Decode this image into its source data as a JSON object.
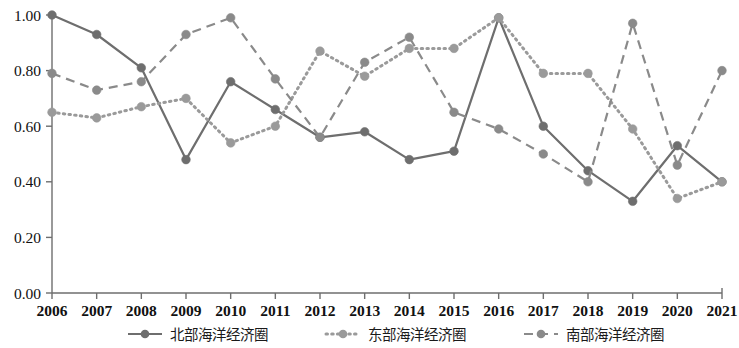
{
  "chart_data": {
    "type": "line",
    "title": "",
    "subtitle": "",
    "xlabel": "",
    "ylabel": "",
    "categories": [
      "2006",
      "2007",
      "2008",
      "2009",
      "2010",
      "2011",
      "2012",
      "2013",
      "2014",
      "2015",
      "2016",
      "2017",
      "2018",
      "2019",
      "2020",
      "2021"
    ],
    "ylim": [
      0.0,
      1.0
    ],
    "xlim": [
      "2006",
      "2021"
    ],
    "ytick_labels": [
      "0.00",
      "0.20",
      "0.40",
      "0.60",
      "0.80",
      "1.00"
    ],
    "ytick_values": [
      0.0,
      0.2,
      0.4,
      0.6,
      0.8,
      1.0
    ],
    "grid": false,
    "legend_position": "bottom",
    "series": [
      {
        "name": "北部海洋经济圈",
        "style": "solid",
        "color": "#6e6e6e",
        "marker": "circle",
        "values": [
          1.0,
          0.93,
          0.81,
          0.48,
          0.76,
          0.66,
          0.56,
          0.58,
          0.48,
          0.51,
          0.99,
          0.6,
          0.44,
          0.33,
          0.53,
          0.4
        ]
      },
      {
        "name": "东部海洋经济圈",
        "style": "dotted",
        "color": "#9a9a9a",
        "marker": "circle",
        "values": [
          0.65,
          0.63,
          0.67,
          0.7,
          0.54,
          0.6,
          0.87,
          0.78,
          0.88,
          0.88,
          0.99,
          0.79,
          0.79,
          0.59,
          0.34,
          0.4
        ]
      },
      {
        "name": "南部海洋经济圈",
        "style": "dashed",
        "color": "#8a8a8a",
        "marker": "circle",
        "values": [
          0.79,
          0.73,
          0.76,
          0.93,
          0.99,
          0.77,
          0.56,
          0.83,
          0.92,
          0.65,
          0.59,
          0.5,
          0.4,
          0.97,
          0.46,
          0.8
        ]
      }
    ]
  },
  "legend": {
    "items": [
      {
        "label": "北部海洋经济圈",
        "style": "solid"
      },
      {
        "label": "东部海洋经济圈",
        "style": "dotted"
      },
      {
        "label": "南部海洋经济圈",
        "style": "dashed"
      }
    ]
  },
  "axes": {
    "y_ticks": [
      "0.00",
      "0.20",
      "0.40",
      "0.60",
      "0.80",
      "1.00"
    ],
    "x_ticks": [
      "2006",
      "2007",
      "2008",
      "2009",
      "2010",
      "2011",
      "2012",
      "2013",
      "2014",
      "2015",
      "2016",
      "2017",
      "2018",
      "2019",
      "2020",
      "2021"
    ]
  }
}
